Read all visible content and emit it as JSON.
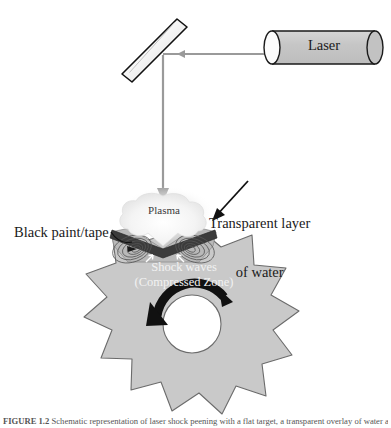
{
  "figure": {
    "type": "schematic-diagram",
    "background_color": "#ffffff"
  },
  "labels": {
    "laser": "Laser",
    "plasma": "Plasma",
    "transparent_water_line1": "Transparent layer",
    "transparent_water_line2": "of water",
    "black_paint": "Black paint/tape",
    "shock_waves_line1": "Shock waves",
    "shock_waves_line2": "(Compressed Zone)"
  },
  "caption": {
    "label": "FIGURE 1.2",
    "text": "Schematic representation of laser shock peening with a flat target, a transparent overlay of water and an opaque coating."
  },
  "colors": {
    "star_fill": "#c9c9c9",
    "star_stroke": "#555555",
    "laser_body": "#c2c2c2",
    "laser_stroke": "#1a1a1a",
    "mirror_fill": "#ededed",
    "mirror_stroke": "#111111",
    "beam": "#9a9a9a",
    "plasma_cloud": "#f2f2f2",
    "paint_layer": "#3b3b3b",
    "water_layer": "#b9b9b9",
    "arrow_black": "#111111",
    "text": "#1a1a1a",
    "shock_text": "#f2f2f2"
  },
  "elements": {
    "laser_source": "laser-cylinder",
    "mirror": "tilted-mirror",
    "beam_horizontal": "horizontal-beam-arrow",
    "beam_vertical": "vertical-beam-arrow",
    "plasma": "plasma-cloud",
    "water_layer": "transparent-water-layer",
    "paint_layer": "black-paint-tape-layer",
    "target": "star-burst-target",
    "center_hole": "center-hole",
    "rotation_arrow": "curved-rotation-arrow",
    "leader_water": "water-leader-arrow",
    "leader_paint": "paint-leader-line",
    "wave_arrows": "shock-wave-arrows"
  }
}
